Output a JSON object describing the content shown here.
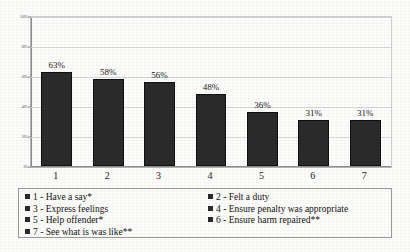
{
  "chart_data": {
    "type": "bar",
    "title": "",
    "xlabel": "",
    "ylabel": "",
    "categories": [
      "1",
      "2",
      "3",
      "4",
      "5",
      "6",
      "7"
    ],
    "values": [
      63,
      58,
      56,
      48,
      36,
      31,
      31
    ],
    "data_labels": [
      "63%",
      "58%",
      "56%",
      "48%",
      "36%",
      "31%",
      "31%"
    ],
    "ylim": [
      0,
      100
    ],
    "yticks": [
      0,
      20,
      40,
      60,
      80,
      100
    ],
    "ytick_labels": [
      "0%",
      "20%",
      "40%",
      "60%",
      "80%",
      "100%"
    ],
    "grid": true,
    "legend_position": "bottom",
    "series": [
      {
        "name": "Percentage",
        "color": "#2b2b2b",
        "values": [
          63,
          58,
          56,
          48,
          36,
          31,
          31
        ]
      }
    ],
    "legend_entries": [
      {
        "key": "1",
        "label": "1 - Have a say*"
      },
      {
        "key": "2",
        "label": "2 - Felt a duty"
      },
      {
        "key": "3",
        "label": "3 - Express feelings"
      },
      {
        "key": "4",
        "label": "4 - Ensure penalty was appropriate"
      },
      {
        "key": "5",
        "label": "5 - Help offender*"
      },
      {
        "key": "6",
        "label": "6 - Ensure harm repaired**"
      },
      {
        "key": "7",
        "label": "7 - See what is was like**"
      }
    ],
    "legend_columns": {
      "left": [
        "1 - Have a say*",
        "3 - Express feelings",
        "5 - Help offender*",
        "7 - See what is was like**"
      ],
      "right": [
        "2 - Felt a duty",
        "4 - Ensure penalty was appropriate",
        "6 - Ensure harm repaired**"
      ]
    },
    "colors": {
      "bar": "#2b2b2b",
      "axis": "#8d8d8d",
      "grid": "#d8d8d8",
      "text": "#121212",
      "background": "#fdfdfb"
    }
  }
}
